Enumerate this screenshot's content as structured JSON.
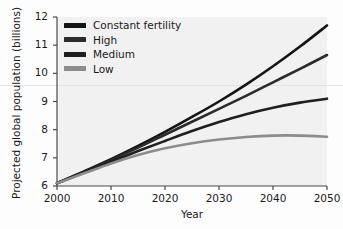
{
  "chart_data": {
    "type": "line",
    "title": "",
    "xlabel": "Year",
    "ylabel": "Projected global population (billions)",
    "xlim": [
      2000,
      2050
    ],
    "ylim": [
      6,
      12
    ],
    "xticks": [
      "2000",
      "2010",
      "2020",
      "2030",
      "2040",
      "2050"
    ],
    "yticks": [
      "6",
      "7",
      "8",
      "9",
      "10",
      "11",
      "12"
    ],
    "grid": false,
    "legend_position": "top-left",
    "x": [
      2000,
      2005,
      2010,
      2015,
      2020,
      2025,
      2030,
      2035,
      2040,
      2045,
      2050
    ],
    "series": [
      {
        "name": "Constant fertility",
        "color": "#141414",
        "values": [
          6.1,
          6.52,
          6.95,
          7.42,
          7.92,
          8.45,
          9.0,
          9.6,
          10.25,
          10.95,
          11.7
        ]
      },
      {
        "name": "High",
        "color": "#2b2b2b",
        "values": [
          6.1,
          6.5,
          6.92,
          7.36,
          7.82,
          8.28,
          8.74,
          9.2,
          9.68,
          10.16,
          10.65
        ]
      },
      {
        "name": "Medium",
        "color": "#1f1f1f",
        "values": [
          6.1,
          6.48,
          6.86,
          7.24,
          7.6,
          7.95,
          8.27,
          8.55,
          8.78,
          8.96,
          9.1
        ]
      },
      {
        "name": "Low",
        "color": "#8c8c8c",
        "values": [
          6.1,
          6.45,
          6.8,
          7.1,
          7.34,
          7.52,
          7.65,
          7.74,
          7.79,
          7.79,
          7.75
        ]
      }
    ]
  },
  "axis": {
    "xlabel": "Year",
    "ylabel": "Projected global population (billions)"
  }
}
